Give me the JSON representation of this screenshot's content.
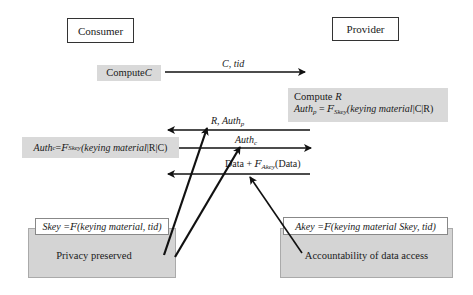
{
  "parties": {
    "consumer": "Consumer",
    "provider": "Provider"
  },
  "consumer_steps": {
    "compute_c_prefix": "Compute ",
    "compute_c_var": "C",
    "auth_c_lhs": "Auth",
    "auth_c_sub": "c",
    "auth_c_eq": " = ",
    "auth_c_f": "F",
    "auth_c_fsub": "Skey",
    "auth_c_arg": "(keying material",
    "auth_c_tail": "|R|C)"
  },
  "provider_steps": {
    "compute_r_prefix": "Compute ",
    "compute_r_var": "R",
    "auth_p_lhs": "Auth",
    "auth_p_sub": "p",
    "auth_p_eq": " = ",
    "auth_p_f": "F",
    "auth_p_fsub": "Skey",
    "auth_p_arg": "(keying material",
    "auth_p_tail": "|C|R)"
  },
  "messages": [
    {
      "id": "m1",
      "direction": "consumer-to-provider",
      "label": "C, tid"
    },
    {
      "id": "m2",
      "direction": "provider-to-consumer",
      "label_main": "R, Auth",
      "label_sub": "p"
    },
    {
      "id": "m3",
      "direction": "consumer-to-provider",
      "label_main": "Auth",
      "label_sub": "c"
    },
    {
      "id": "m4",
      "direction": "provider-to-consumer",
      "label_pre": "Data + ",
      "label_f": "F",
      "label_fsub": "Akey",
      "label_post": "(Data)"
    }
  ],
  "bottom_boxes": {
    "left": {
      "key_lhs": "Skey = ",
      "key_f": "F",
      "key_args": "(keying material, tid)",
      "caption": "Privacy preserved"
    },
    "right": {
      "key_lhs": "Akey = ",
      "key_f": "F",
      "key_args": "(keying material Skey, tid)",
      "caption": "Accountability of data access"
    }
  },
  "colors": {
    "gray_fill": "#d9d9d9",
    "box_fill": "#d4d4d4",
    "line": "#111111"
  }
}
